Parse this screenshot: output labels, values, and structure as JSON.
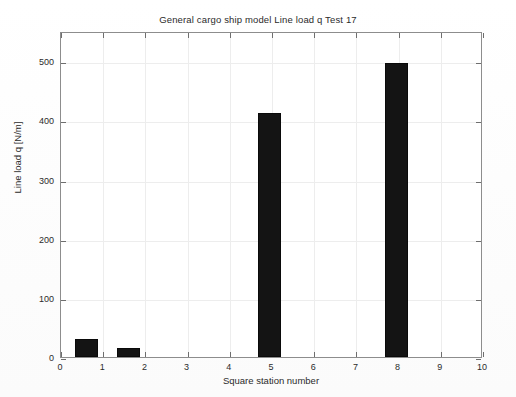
{
  "chart_data": {
    "type": "bar",
    "title": "General cargo ship model Line load q Test 17",
    "xlabel": "Square station number",
    "ylabel": "Line load q [N/m]",
    "x": [
      0.6,
      1.6,
      4.95,
      7.95
    ],
    "values": [
      31,
      15,
      412,
      497
    ],
    "bar_width": 0.55,
    "categories": [
      "0.6",
      "1.6",
      "4.95",
      "7.95"
    ],
    "xlim": [
      0,
      10
    ],
    "ylim": [
      0,
      551
    ],
    "xticks": [
      0,
      1,
      2,
      3,
      4,
      5,
      6,
      7,
      8,
      9,
      10
    ],
    "xtick_labels": [
      "0",
      "1",
      "2",
      "3",
      "4",
      "5",
      "6",
      "7",
      "8",
      "9",
      "10"
    ],
    "yticks": [
      0,
      100,
      200,
      300,
      400,
      500
    ],
    "ytick_labels": [
      "0",
      "100",
      "200",
      "300",
      "400",
      "500"
    ],
    "grid": true,
    "legend": null,
    "bar_color": "#141414",
    "grid_color": "#ededed",
    "axis_color": "#8d8d8d",
    "background_color": "#ffffff"
  }
}
